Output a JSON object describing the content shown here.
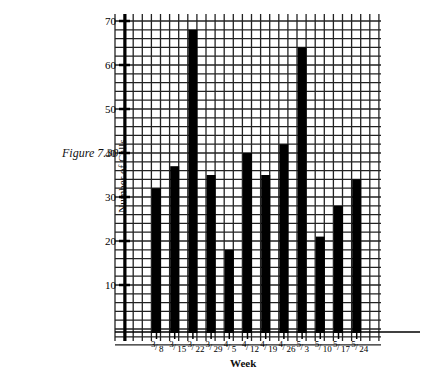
{
  "figure_label": "Figure 7.30",
  "chart_data": {
    "type": "bar",
    "title": "",
    "xlabel": "Week",
    "ylabel": "Number of Calls",
    "categories": [
      "3/8",
      "3/15",
      "3/22",
      "3/29",
      "4/5",
      "4/12",
      "4/19",
      "4/26",
      "5/3",
      "5/10",
      "5/17",
      "5/24"
    ],
    "values": [
      32,
      37,
      68,
      35,
      18,
      40,
      35,
      42,
      64,
      21,
      28,
      34
    ],
    "yticks": [
      10,
      20,
      30,
      40,
      50,
      60,
      70
    ],
    "ylim": [
      0,
      70
    ],
    "grid": true,
    "legend": null
  },
  "colors": {
    "bar": "#000000",
    "grid": "#222222",
    "background": "#ffffff"
  }
}
